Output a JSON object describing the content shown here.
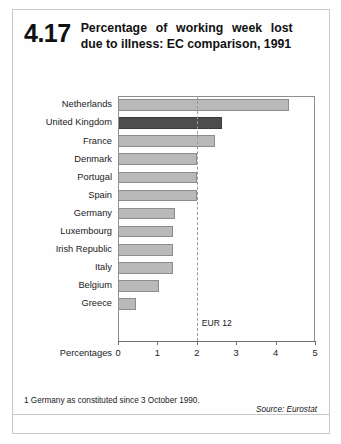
{
  "figure": {
    "number": "4.17",
    "title": "Percentage of working week lost due to illness: EC comparison, 1991"
  },
  "axis": {
    "title": "Percentages",
    "ticks": [
      "0",
      "1",
      "2",
      "3",
      "4",
      "5"
    ]
  },
  "annotation": {
    "eur_label": "EUR 12"
  },
  "footnote": {
    "text": "1 Germany as constituted since 3 October 1990."
  },
  "source": {
    "text": "Source: Eurostat"
  },
  "colors": {
    "bar": "#b9b9b9",
    "bar_highlight": "#4d4d4d",
    "frame": "#8f8f8f"
  },
  "chart_data": {
    "type": "bar",
    "orientation": "horizontal",
    "title": "Percentage of working week lost due to illness: EC comparison, 1991",
    "xlabel": "Percentages",
    "ylabel": "",
    "xlim": [
      0,
      5
    ],
    "xticks": [
      0,
      1,
      2,
      3,
      4,
      5
    ],
    "grid": false,
    "legend": false,
    "highlight_category": "United Kingdom",
    "reference_line": {
      "label": "EUR 12",
      "value": 2.0,
      "style": "dashed"
    },
    "categories": [
      "Netherlands",
      "United Kingdom",
      "France",
      "Denmark",
      "Portugal",
      "Spain",
      "Germany",
      "Luxembourg",
      "Irish Republic",
      "Italy",
      "Belgium",
      "Greece"
    ],
    "values": [
      4.35,
      2.65,
      2.45,
      2.0,
      2.0,
      2.0,
      1.45,
      1.4,
      1.4,
      1.4,
      1.05,
      0.45
    ]
  }
}
